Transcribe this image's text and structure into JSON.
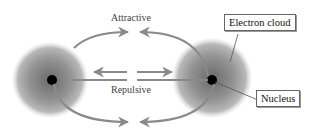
{
  "diagram": {
    "labels": {
      "attractive": "Attractive",
      "repulsive": "Repulsive",
      "electron_cloud": "Electron cloud",
      "nucleus": "Nucleus"
    },
    "colors": {
      "arrow": "#8a8a8a",
      "cloud": "#9a9a9a",
      "nucleus": "#000000"
    },
    "atoms": [
      {
        "name": "left-atom",
        "cx": 50,
        "cy": 80
      },
      {
        "name": "right-atom",
        "cx": 212,
        "cy": 80
      }
    ]
  }
}
